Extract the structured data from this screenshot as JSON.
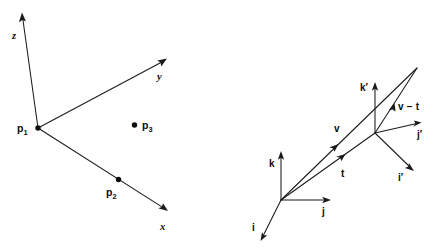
{
  "figure": {
    "background_color": "#ffffff",
    "ink_color": "#1a1a1a",
    "width": 435,
    "height": 251
  },
  "diagrams": [
    {
      "id": "left-coordinate-frame",
      "name": "point-triple-axis-diagram",
      "origin_label": "p",
      "origin_subscript": "1",
      "axes": [
        {
          "name": "z-axis",
          "label": "z",
          "style": "italic"
        },
        {
          "name": "y-axis",
          "label": "y",
          "style": "italic"
        },
        {
          "name": "x-axis",
          "label": "x",
          "style": "italic"
        }
      ],
      "points": [
        {
          "name": "point-p1",
          "label": "p",
          "subscript": "1"
        },
        {
          "name": "point-p2",
          "label": "p",
          "subscript": "2"
        },
        {
          "name": "point-p3",
          "label": "p",
          "subscript": "3"
        }
      ]
    },
    {
      "id": "right-basis-frame",
      "name": "translated-basis-vector-diagram",
      "basis_original": [
        {
          "name": "basis-i",
          "label": "i"
        },
        {
          "name": "basis-j",
          "label": "j"
        },
        {
          "name": "basis-k",
          "label": "k"
        }
      ],
      "basis_primed": [
        {
          "name": "basis-i-prime",
          "label": "i′"
        },
        {
          "name": "basis-j-prime",
          "label": "j′"
        },
        {
          "name": "basis-k-prime",
          "label": "k′"
        }
      ],
      "vectors": [
        {
          "name": "vector-v",
          "label": "v"
        },
        {
          "name": "vector-t",
          "label": "t"
        },
        {
          "name": "vector-v-minus-t",
          "label": "v − t"
        }
      ]
    }
  ]
}
